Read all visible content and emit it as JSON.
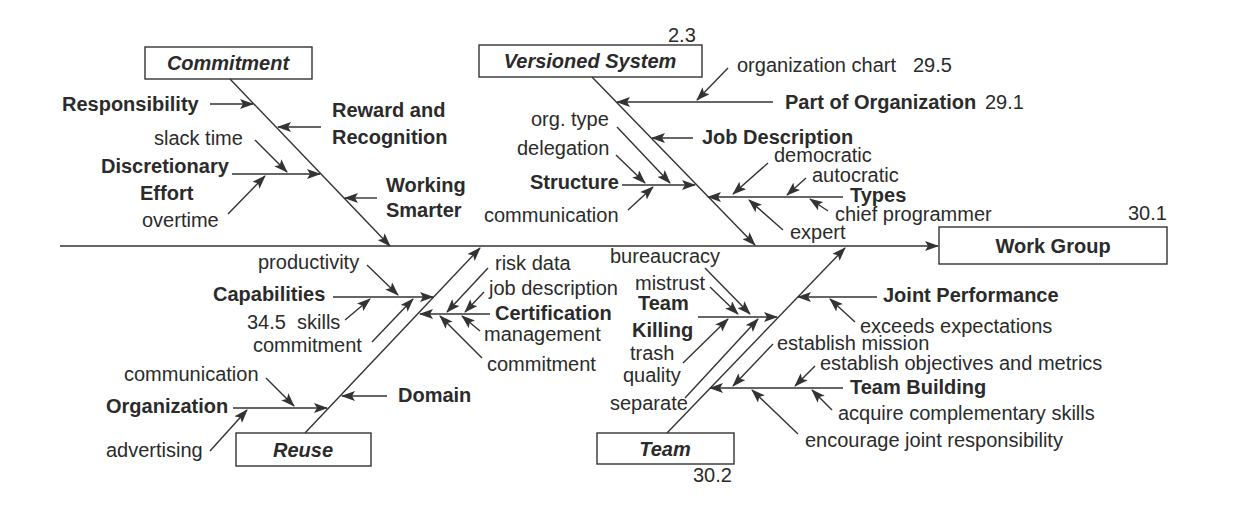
{
  "diagram": {
    "type": "fishbone",
    "effect": {
      "label": "Work Group",
      "ref": "30.1"
    },
    "commitment": {
      "label": "Commitment",
      "causes": [
        {
          "label": "Responsibility"
        },
        {
          "lines": [
            "Reward and",
            "Recognition"
          ]
        },
        {
          "lines": [
            "Discretionary",
            "Effort"
          ],
          "subcauses": [
            "slack time",
            "overtime"
          ]
        },
        {
          "lines": [
            "Working",
            "Smarter"
          ]
        }
      ]
    },
    "versioned_system": {
      "label": "Versioned System",
      "ref": "2.3",
      "causes": [
        {
          "label": "Part of Organization",
          "ref": "29.1",
          "subcauses": [
            {
              "label": "organization chart",
              "ref": "29.5"
            }
          ]
        },
        {
          "label": "Job Description"
        },
        {
          "label": "Structure",
          "subcauses": [
            "org. type",
            "delegation",
            "communication"
          ]
        },
        {
          "label": "Types",
          "subcauses": [
            "democratic",
            "autocratic",
            "chief programmer",
            "expert"
          ]
        }
      ]
    },
    "reuse": {
      "label": "Reuse",
      "causes": [
        {
          "label": "Capabilities",
          "subcauses": [
            "productivity",
            {
              "ref": "34.5",
              "label": "skills"
            },
            "commitment"
          ]
        },
        {
          "label": "Certification",
          "subcauses": [
            "risk data",
            "job description",
            "management",
            "commitment"
          ]
        },
        {
          "label": "Domain"
        },
        {
          "label": "Organization",
          "subcauses": [
            "communication",
            "advertising"
          ]
        }
      ]
    },
    "team": {
      "label": "Team",
      "ref": "30.2",
      "causes": [
        {
          "lines": [
            "Team",
            "Killing"
          ],
          "subcauses": [
            "bureaucracy",
            "mistrust",
            {
              "lines": [
                "trash",
                "quality"
              ]
            },
            "separate"
          ]
        },
        {
          "label": "Joint Performance",
          "subcauses": [
            "exceeds expectations"
          ]
        },
        {
          "label": "Team Building",
          "subcauses": [
            "establish mission",
            "establish objectives and metrics",
            "acquire complementary skills",
            "encourage joint responsibility"
          ]
        }
      ]
    }
  }
}
